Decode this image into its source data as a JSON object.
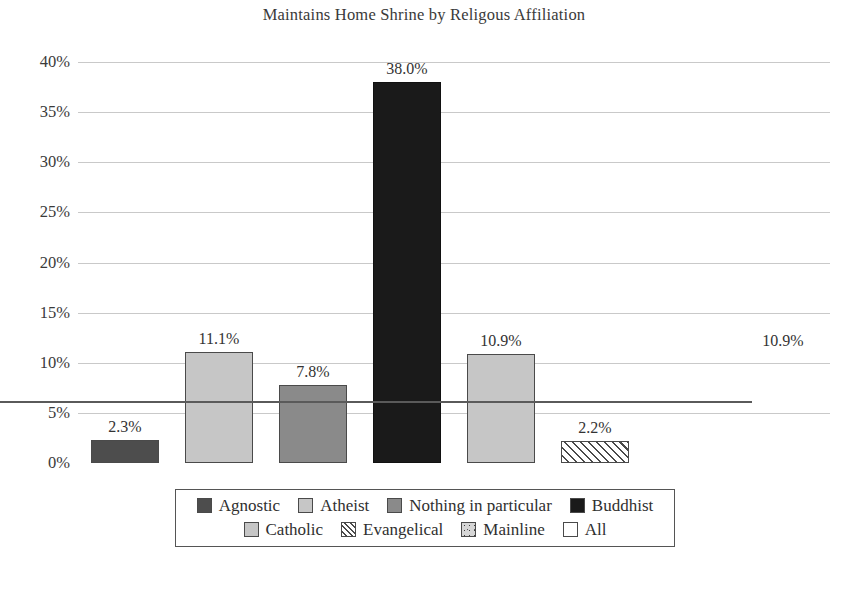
{
  "chart_data": {
    "type": "bar",
    "title": "Maintains Home Shrine by Religous Affiliation",
    "xlabel": "",
    "ylabel": "",
    "ylim": [
      0,
      40
    ],
    "grid": true,
    "legend_position": "bottom",
    "categories": [
      "Agnostic",
      "Atheist",
      "Nothing in particular",
      "Buddhist",
      "Catholic",
      "Evangelical",
      "Mainline",
      "All"
    ],
    "values": [
      2.3,
      11.1,
      7.8,
      38.0,
      10.9,
      2.2,
      0.0,
      10.9
    ],
    "value_labels": [
      "2.3%",
      "11.1%",
      "7.8%",
      "38.0%",
      "10.9%",
      "2.2%",
      "",
      "10.9%"
    ],
    "ytick_labels": [
      "40%",
      "35%",
      "30%",
      "25%",
      "20%",
      "15%",
      "10%",
      "5%",
      "0%"
    ],
    "ytick_values": [
      40,
      35,
      30,
      25,
      20,
      15,
      10,
      5,
      0
    ],
    "series_styles": [
      "dark-gray-solid",
      "light-gray-solid",
      "medium-gray-solid",
      "black-solid",
      "light-gray-solid",
      "diagonal-hatch",
      "speckled",
      "dotted"
    ],
    "colors": {
      "dark_gray": "#4d4d4d",
      "light_gray": "#c6c6c6",
      "medium_gray": "#8a8a8a",
      "black": "#1a1a1a",
      "grid": "#c9c9c9",
      "axis": "#5a5a5a",
      "text": "#2f2f2f"
    }
  },
  "legend": {
    "rows": [
      [
        {
          "label": "Agnostic",
          "style": "fill-darkgray"
        },
        {
          "label": "Atheist",
          "style": "fill-lightgray"
        },
        {
          "label": "Nothing in particular",
          "style": "fill-midgray"
        },
        {
          "label": "Buddhist",
          "style": "fill-black"
        }
      ],
      [
        {
          "label": "Catholic",
          "style": "fill-lightgray"
        },
        {
          "label": "Evangelical",
          "style": "fill-hatch"
        },
        {
          "label": "Mainline",
          "style": "fill-speckle"
        },
        {
          "label": "All",
          "style": "fill-none"
        }
      ]
    ]
  }
}
